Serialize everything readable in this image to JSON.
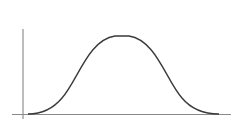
{
  "diagram": {
    "type": "bell-curve",
    "colors": {
      "background": "#ffffff",
      "axis": "#7a7a7a",
      "curve": "#3a3a3a"
    },
    "axes": {
      "y_axis": {
        "x": 23,
        "y_top": 29,
        "y_bottom": 119
      },
      "x_axis": {
        "y": 114,
        "x_left": 12,
        "x_right": 231
      }
    },
    "curve": {
      "start_x": 28,
      "peak_x": 122,
      "peak_y": 35,
      "end_x": 219,
      "baseline_y": 114
    }
  }
}
